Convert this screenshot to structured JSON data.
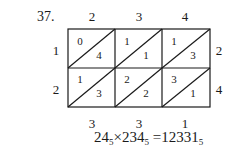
{
  "problem_number": "37.",
  "top_digits": [
    "2",
    "3",
    "4"
  ],
  "right_digits": [
    "2",
    "4"
  ],
  "left_sums": [
    "1",
    "2"
  ],
  "bottom_sums": [
    "3",
    "3",
    "1"
  ],
  "cells": [
    [
      {
        "tens": "0",
        "ones": "4"
      },
      {
        "tens": "1",
        "ones": "1"
      },
      {
        "tens": "1",
        "ones": "3"
      }
    ],
    [
      {
        "tens": "1",
        "ones": "3"
      },
      {
        "tens": "2",
        "ones": "2"
      },
      {
        "tens": "3",
        "ones": "1"
      }
    ]
  ],
  "equation": {
    "a": "24",
    "a_base": "5",
    "times": "×",
    "b": "234",
    "b_base": "5",
    "equals": "=",
    "result": "12331",
    "result_base": "5"
  },
  "colors": {
    "line": "#1a1a1a",
    "text": "#1a1a1a",
    "background": "#ffffff"
  }
}
